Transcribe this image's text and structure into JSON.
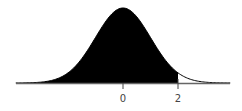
{
  "chart_data": {
    "type": "area",
    "title": "",
    "xlabel": "",
    "ylabel": "",
    "distribution": "standard normal",
    "mean": 0,
    "sd": 1,
    "shaded_region": {
      "from": "-inf",
      "to": 2
    },
    "xlim": [
      -3.9,
      3.9
    ],
    "tick_labels": [
      "0",
      "2"
    ],
    "tick_values": [
      0,
      2
    ],
    "grid": false,
    "colors": {
      "fill": "#000000",
      "axis": "#666666"
    }
  }
}
